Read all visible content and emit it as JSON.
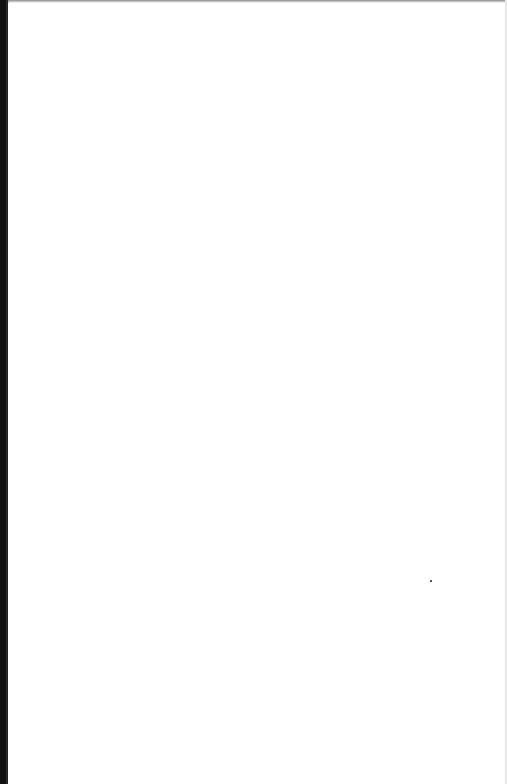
{
  "document": {
    "type": "scanned-page",
    "content": "",
    "background_color": "#ffffff",
    "scan_edge_color": "#111111"
  }
}
